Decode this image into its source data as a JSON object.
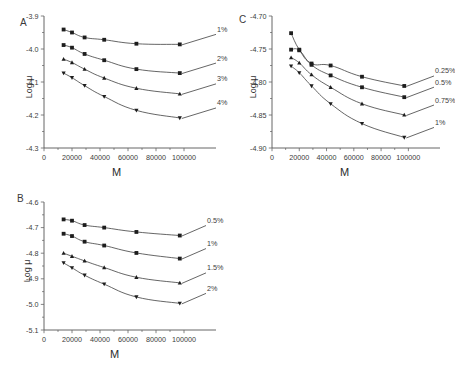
{
  "figure": {
    "background": "#ffffff",
    "ink_color": "#2b2b2b",
    "marker_color": "#1d1d1d",
    "curve_color": "#4a4a4a"
  },
  "panels": [
    {
      "letter": "A",
      "xlabel": "M",
      "ylabel": "Log μ",
      "xticks": [
        "0",
        "20000",
        "40000",
        "60000",
        "80000",
        "100000"
      ],
      "yticks": [
        "-3.9",
        "-4.0",
        "-4.1",
        "-4.2",
        "-4.3"
      ],
      "series_labels": [
        "1%",
        "2%",
        "3%",
        "4%"
      ]
    },
    {
      "letter": "B",
      "xlabel": "M",
      "ylabel": "Log μ",
      "xticks": [
        "0",
        "20000",
        "40000",
        "60000",
        "80000",
        "100000"
      ],
      "yticks": [
        "-4.6",
        "-4.7",
        "-4.8",
        "-4.9",
        "-5.0",
        "-5.1"
      ],
      "series_labels": [
        "0.5%",
        "1%",
        "1.5%",
        "2%"
      ]
    },
    {
      "letter": "C",
      "xlabel": "M",
      "ylabel": "Log μ",
      "xticks": [
        "0",
        "20000",
        "40000",
        "60000",
        "80000",
        "100000"
      ],
      "yticks": [
        "-4.70",
        "-4.75",
        "-4.80",
        "-4.85",
        "-4.90"
      ],
      "series_labels": [
        "0.25%",
        "0.5%",
        "0.75%",
        "1%"
      ]
    }
  ],
  "chart_data": [
    {
      "type": "line",
      "panel": "A",
      "title": "",
      "xlabel": "M",
      "ylabel": "Log μ",
      "xlim": [
        0,
        110000
      ],
      "ylim": [
        -4.3,
        -3.9
      ],
      "xticks": [
        0,
        20000,
        40000,
        60000,
        80000,
        100000
      ],
      "yticks": [
        -3.9,
        -4.0,
        -4.1,
        -4.2,
        -4.3
      ],
      "grid": false,
      "legend_position": "right-inline",
      "x": [
        14000,
        20000,
        29000,
        43000,
        66000,
        97000
      ],
      "series": [
        {
          "name": "1%",
          "marker": "square",
          "values": [
            -3.941,
            -3.95,
            -3.965,
            -3.972,
            -3.984,
            -3.986
          ]
        },
        {
          "name": "2%",
          "marker": "square",
          "values": [
            -3.988,
            -3.996,
            -4.015,
            -4.034,
            -4.061,
            -4.073
          ]
        },
        {
          "name": "3%",
          "marker": "triangle-up",
          "values": [
            -4.031,
            -4.041,
            -4.061,
            -4.088,
            -4.119,
            -4.136
          ]
        },
        {
          "name": "4%",
          "marker": "triangle-down",
          "values": [
            -4.073,
            -4.087,
            -4.111,
            -4.144,
            -4.186,
            -4.209
          ]
        }
      ]
    },
    {
      "type": "line",
      "panel": "B",
      "title": "",
      "xlabel": "M",
      "ylabel": "Log μ",
      "xlim": [
        0,
        110000
      ],
      "ylim": [
        -5.1,
        -4.6
      ],
      "xticks": [
        0,
        20000,
        40000,
        60000,
        80000,
        100000
      ],
      "yticks": [
        -4.6,
        -4.7,
        -4.8,
        -4.9,
        -5.0,
        -5.1
      ],
      "grid": false,
      "legend_position": "right-inline",
      "x": [
        14000,
        20000,
        29000,
        43000,
        66000,
        97000
      ],
      "series": [
        {
          "name": "0.5%",
          "marker": "square",
          "values": [
            -4.668,
            -4.673,
            -4.69,
            -4.7,
            -4.717,
            -4.731
          ]
        },
        {
          "name": "1%",
          "marker": "square",
          "values": [
            -4.724,
            -4.733,
            -4.755,
            -4.77,
            -4.799,
            -4.821
          ]
        },
        {
          "name": "1.5%",
          "marker": "triangle-up",
          "values": [
            -4.8,
            -4.812,
            -4.83,
            -4.856,
            -4.894,
            -4.916
          ]
        },
        {
          "name": "2%",
          "marker": "triangle-down",
          "values": [
            -4.838,
            -4.857,
            -4.886,
            -4.921,
            -4.971,
            -4.996
          ]
        }
      ]
    },
    {
      "type": "line",
      "panel": "C",
      "title": "",
      "xlabel": "M",
      "ylabel": "Log μ",
      "xlim": [
        0,
        110000
      ],
      "ylim": [
        -4.9,
        -4.7
      ],
      "xticks": [
        0,
        20000,
        40000,
        60000,
        80000,
        100000
      ],
      "yticks": [
        -4.7,
        -4.75,
        -4.8,
        -4.85,
        -4.9
      ],
      "grid": false,
      "legend_position": "right-inline",
      "x": [
        14000,
        20000,
        29000,
        43000,
        66000,
        97000
      ],
      "series": [
        {
          "name": "0.25%",
          "marker": "square",
          "values": [
            -4.726,
            -4.751,
            -4.772,
            -4.775,
            -4.792,
            -4.806
          ]
        },
        {
          "name": "0.5%",
          "marker": "square",
          "values": [
            -4.751,
            -4.752,
            -4.774,
            -4.79,
            -4.808,
            -4.823
          ]
        },
        {
          "name": "0.75%",
          "marker": "triangle-up",
          "values": [
            -4.763,
            -4.771,
            -4.789,
            -4.808,
            -4.833,
            -4.85
          ]
        },
        {
          "name": "1%",
          "marker": "triangle-down",
          "values": [
            -4.776,
            -4.786,
            -4.806,
            -4.833,
            -4.863,
            -4.884
          ]
        }
      ]
    }
  ]
}
